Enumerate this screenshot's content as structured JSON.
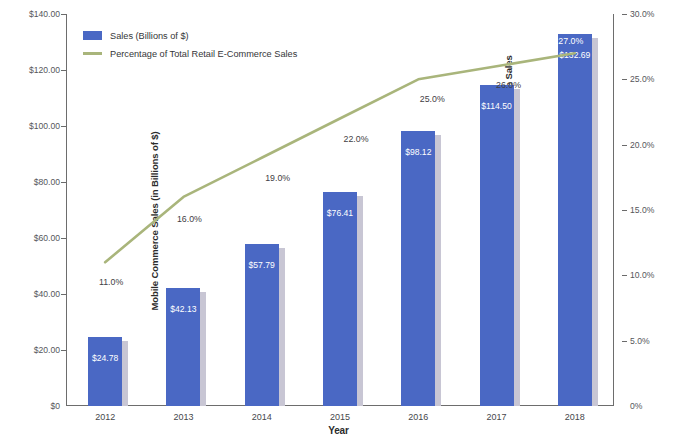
{
  "chart_data": {
    "type": "bar",
    "title": "",
    "xlabel": "Year",
    "categories": [
      "2012",
      "2013",
      "2014",
      "2015",
      "2016",
      "2017",
      "2018"
    ],
    "grid": false,
    "legend_position": "top-left",
    "series": [
      {
        "name": "Sales (Billions of $)",
        "type": "bar",
        "axis": "left",
        "color": "#4a68c4",
        "values": [
          24.78,
          42.13,
          57.79,
          76.41,
          98.12,
          114.5,
          132.69
        ],
        "data_labels": [
          "$24.78",
          "$42.13",
          "$57.79",
          "$76.41",
          "$98.12",
          "$114.50",
          "$132.69"
        ]
      },
      {
        "name": "Percentage of Total Retail E-Commerce Sales",
        "type": "line",
        "axis": "right",
        "color": "#a9b57b",
        "values": [
          11.0,
          16.0,
          19.0,
          22.0,
          25.0,
          26.0,
          27.0
        ],
        "data_labels": [
          "11.0%",
          "16.0%",
          "19.0%",
          "22.0%",
          "25.0%",
          "26.0%",
          "27.0%"
        ]
      }
    ],
    "axes": {
      "left": {
        "title": "Mobile Commerce Sales (in Billions of $)",
        "ylim": [
          0,
          140
        ],
        "tick_values": [
          0,
          20,
          40,
          60,
          80,
          100,
          120,
          140
        ],
        "tick_labels": [
          "$0",
          "$20.00",
          "$40.00",
          "$60.00",
          "$80.00",
          "$100.00",
          "$120.00",
          "$140.00"
        ]
      },
      "right": {
        "title": "Mobile Commerce Sales as a Percentage of Total Retail E-Commerce Sales",
        "ylim": [
          0,
          30
        ],
        "tick_values": [
          0,
          5,
          10,
          15,
          20,
          25,
          30
        ],
        "tick_labels": [
          "0%",
          "5.0%",
          "10.0%",
          "15.0%",
          "20.0%",
          "25.0%",
          "30.0%"
        ]
      }
    }
  },
  "legend": {
    "items": [
      {
        "label": "Sales (Billions of $)",
        "marker": "bar-swatch"
      },
      {
        "label": "Percentage of Total Retail E-Commerce Sales",
        "marker": "line-swatch"
      }
    ]
  },
  "colors": {
    "bar": "#4a68c4",
    "bar_shadow": "#c8c6d4",
    "line": "#a9b57b",
    "axis": "#6d6d6d",
    "tick_text": "#55565a",
    "label_text": "#3f4044",
    "value_text": "#ffffff",
    "background": "#ffffff"
  }
}
